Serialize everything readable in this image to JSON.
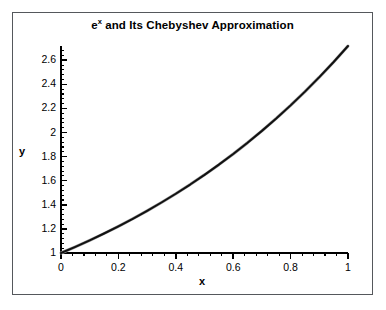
{
  "chart_data": {
    "type": "line",
    "title_base": "e",
    "title_sup": "x",
    "title_rest": " and Its Chebyshev Approximation",
    "xlabel": "x",
    "ylabel": "y",
    "xlim": [
      0,
      1
    ],
    "ylim": [
      1,
      2.7182818
    ],
    "xticks": [
      0,
      0.2,
      0.4,
      0.6,
      0.8,
      1
    ],
    "xtick_labels": [
      "0",
      "0.2",
      "0.4",
      "0.6",
      "0.8",
      "1"
    ],
    "yticks": [
      1,
      1.2,
      1.4,
      1.6,
      1.8,
      2,
      2.2,
      2.4,
      2.6
    ],
    "ytick_labels": [
      "1",
      "1.2",
      "1.4",
      "1.6",
      "1.8",
      "2",
      "2.2",
      "2.4",
      "2.6"
    ],
    "x_minor_step": 0.04,
    "y_minor_step": 0.04,
    "grid": false,
    "legend": null,
    "frame": "outer-box-only",
    "background": "#ffffff",
    "series": [
      {
        "name": "Chebyshev approximation",
        "color": "#9a9a9a",
        "width": 3.0,
        "x": [
          0,
          0.05,
          0.1,
          0.15,
          0.2,
          0.25,
          0.3,
          0.35,
          0.4,
          0.45,
          0.5,
          0.55,
          0.6,
          0.65,
          0.7,
          0.75,
          0.8,
          0.85,
          0.9,
          0.95,
          1
        ],
        "values": [
          1.0,
          1.0513,
          1.1052,
          1.1618,
          1.2214,
          1.284,
          1.3499,
          1.4191,
          1.4918,
          1.5683,
          1.6487,
          1.7333,
          1.8221,
          1.9155,
          2.0138,
          2.117,
          2.2255,
          2.3396,
          2.4596,
          2.5857,
          2.7183
        ]
      },
      {
        "name": "e^x",
        "color": "#111111",
        "width": 2.0,
        "x": [
          0,
          0.05,
          0.1,
          0.15,
          0.2,
          0.25,
          0.3,
          0.35,
          0.4,
          0.45,
          0.5,
          0.55,
          0.6,
          0.65,
          0.7,
          0.75,
          0.8,
          0.85,
          0.9,
          0.95,
          1
        ],
        "values": [
          1.0,
          1.0513,
          1.1052,
          1.1618,
          1.2214,
          1.284,
          1.3499,
          1.4191,
          1.4918,
          1.5683,
          1.6487,
          1.7333,
          1.8221,
          1.9155,
          2.0138,
          2.117,
          2.2255,
          2.3396,
          2.4596,
          2.5857,
          2.7183
        ]
      }
    ]
  }
}
